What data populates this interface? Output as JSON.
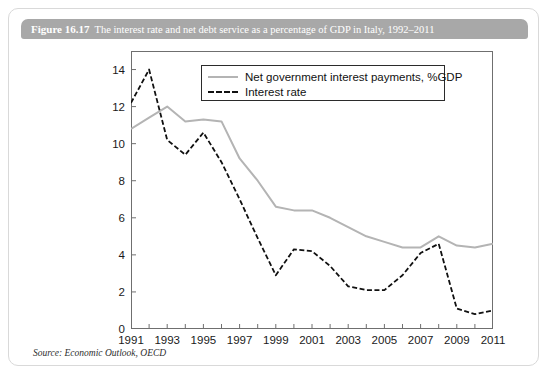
{
  "figure": {
    "number": "Figure 16.17",
    "title": "The interest rate and net debt service as a percentage of GDP in Italy, 1992–2011",
    "source": "Source: Economic Outlook, OECD"
  },
  "colors": {
    "header_bar": "#a8a8a8",
    "header_text": "#ffffff",
    "gray_series": "#b4b4b4",
    "black_series": "#111111",
    "frame": "#6f6f6f",
    "card_border": "#d9d9d9"
  },
  "chart_data": {
    "type": "line",
    "title": "The interest rate and net debt service as a percentage of GDP in Italy, 1992–2011",
    "xlabel": "",
    "ylabel": "",
    "xlim": [
      1991,
      2011
    ],
    "ylim": [
      0,
      15
    ],
    "grid": false,
    "legend_position": "top-center",
    "ytick_labels": [
      "0",
      "2",
      "4",
      "6",
      "8",
      "10",
      "12",
      "14"
    ],
    "yticks": [
      0,
      2,
      4,
      6,
      8,
      10,
      12,
      14
    ],
    "xtick_labels": [
      "1991",
      "1993",
      "1995",
      "1997",
      "1999",
      "2001",
      "2003",
      "2005",
      "2007",
      "2009",
      "2011"
    ],
    "xticks": [
      1991,
      1993,
      1995,
      1997,
      1999,
      2001,
      2003,
      2005,
      2007,
      2009,
      2011
    ],
    "x": [
      1991,
      1992,
      1993,
      1994,
      1995,
      1996,
      1997,
      1998,
      1999,
      2000,
      2001,
      2002,
      2003,
      2004,
      2005,
      2006,
      2007,
      2008,
      2009,
      2010,
      2011
    ],
    "series": [
      {
        "name": "Net government interest payments, %GDP",
        "style": "solid",
        "color": "#b4b4b4",
        "values": [
          10.8,
          11.4,
          12.0,
          11.2,
          11.3,
          11.2,
          9.2,
          8.0,
          6.6,
          6.4,
          6.4,
          6.0,
          5.5,
          5.0,
          4.7,
          4.4,
          4.4,
          5.0,
          4.5,
          4.4,
          4.6
        ]
      },
      {
        "name": "Interest rate",
        "style": "dashed",
        "color": "#111111",
        "values": [
          12.2,
          14.0,
          10.2,
          9.4,
          10.6,
          9.0,
          7.0,
          4.9,
          2.9,
          4.3,
          4.2,
          3.4,
          2.3,
          2.1,
          2.1,
          2.9,
          4.1,
          4.6,
          1.1,
          0.8,
          1.0
        ]
      }
    ]
  },
  "legend": {
    "items": [
      {
        "label": "Net government interest payments, %GDP",
        "style": "solid"
      },
      {
        "label": "Interest rate",
        "style": "dashed"
      }
    ]
  }
}
